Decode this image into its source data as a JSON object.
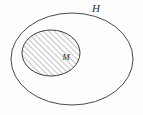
{
  "diagram": {
    "type": "set-containment-venn",
    "background_color": "#fefefe",
    "stroke_color": "#4a4a4a",
    "hatch_color": "#6b6b6b",
    "label_color": "#2b2b2b",
    "outer_set": {
      "label": "H",
      "shape": "ellipse",
      "center_x": 72,
      "center_y": 59,
      "radius_x": 61,
      "radius_y": 46,
      "fill": "none",
      "label_x": 96,
      "label_y": 9,
      "label_font_size": 11
    },
    "inner_set": {
      "label": "M",
      "shape": "ellipse",
      "center_x": 51,
      "center_y": 53,
      "radius_x": 29,
      "radius_y": 23,
      "fill": "diagonal-hatch",
      "hatch_angle_deg": 45,
      "hatch_spacing": 4,
      "label_x": 66,
      "label_y": 58,
      "label_font_size": 9
    }
  }
}
